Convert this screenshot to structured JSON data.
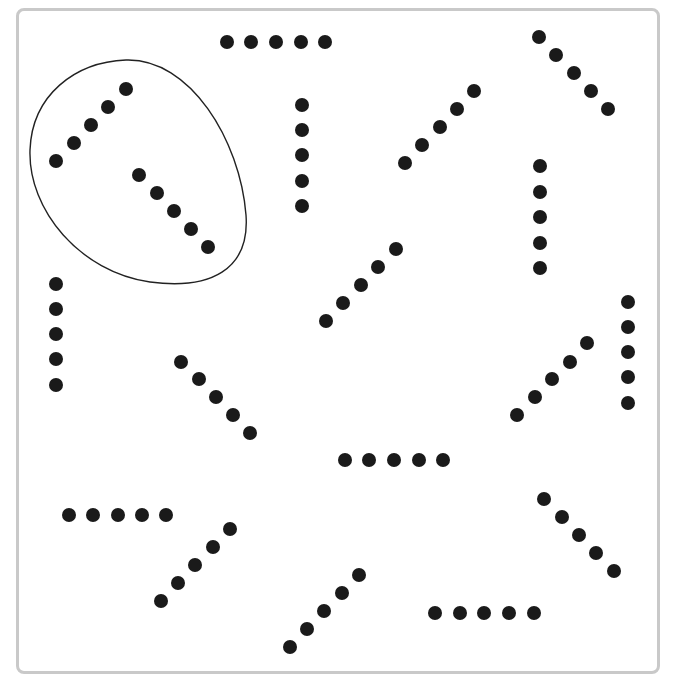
{
  "figure": {
    "frame_color": "#c9c9c9",
    "dot_color": "#1a1a1a",
    "dot_radius": 7,
    "loop": {
      "description": "hand-drawn egg-shaped loop enclosing two groups",
      "path": "M 126 60 C 190 58, 240 140, 246 215 C 250 270, 210 290, 150 282 C 80 272, 28 210, 30 150 C 32 95, 75 62, 126 60 Z"
    },
    "groups": [
      {
        "id": "g1",
        "orientation": "diagonal-up",
        "encircled": true,
        "dots": [
          [
            56,
            161
          ],
          [
            74,
            143
          ],
          [
            91,
            125
          ],
          [
            108,
            107
          ],
          [
            126,
            89
          ]
        ]
      },
      {
        "id": "g2",
        "orientation": "diagonal-down",
        "encircled": true,
        "dots": [
          [
            139,
            175
          ],
          [
            157,
            193
          ],
          [
            174,
            211
          ],
          [
            191,
            229
          ],
          [
            208,
            247
          ]
        ]
      },
      {
        "id": "g3",
        "orientation": "horizontal",
        "encircled": false,
        "dots": [
          [
            227,
            42
          ],
          [
            251,
            42
          ],
          [
            276,
            42
          ],
          [
            301,
            42
          ],
          [
            325,
            42
          ]
        ]
      },
      {
        "id": "g4",
        "orientation": "vertical",
        "encircled": false,
        "dots": [
          [
            302,
            105
          ],
          [
            302,
            130
          ],
          [
            302,
            155
          ],
          [
            302,
            181
          ],
          [
            302,
            206
          ]
        ]
      },
      {
        "id": "g5",
        "orientation": "diagonal-up",
        "encircled": false,
        "dots": [
          [
            405,
            163
          ],
          [
            422,
            145
          ],
          [
            440,
            127
          ],
          [
            457,
            109
          ],
          [
            474,
            91
          ]
        ]
      },
      {
        "id": "g6",
        "orientation": "diagonal-down",
        "encircled": false,
        "dots": [
          [
            539,
            37
          ],
          [
            556,
            55
          ],
          [
            574,
            73
          ],
          [
            591,
            91
          ],
          [
            608,
            109
          ]
        ]
      },
      {
        "id": "g7",
        "orientation": "vertical",
        "encircled": false,
        "dots": [
          [
            540,
            166
          ],
          [
            540,
            192
          ],
          [
            540,
            217
          ],
          [
            540,
            243
          ],
          [
            540,
            268
          ]
        ]
      },
      {
        "id": "g8",
        "orientation": "diagonal-up",
        "encircled": false,
        "dots": [
          [
            326,
            321
          ],
          [
            343,
            303
          ],
          [
            361,
            285
          ],
          [
            378,
            267
          ],
          [
            396,
            249
          ]
        ]
      },
      {
        "id": "g9",
        "orientation": "vertical",
        "encircled": false,
        "dots": [
          [
            56,
            284
          ],
          [
            56,
            309
          ],
          [
            56,
            334
          ],
          [
            56,
            359
          ],
          [
            56,
            385
          ]
        ]
      },
      {
        "id": "g10",
        "orientation": "diagonal-down",
        "encircled": false,
        "dots": [
          [
            181,
            362
          ],
          [
            199,
            379
          ],
          [
            216,
            397
          ],
          [
            233,
            415
          ],
          [
            250,
            433
          ]
        ]
      },
      {
        "id": "g11",
        "orientation": "vertical",
        "encircled": false,
        "dots": [
          [
            628,
            302
          ],
          [
            628,
            327
          ],
          [
            628,
            352
          ],
          [
            628,
            377
          ],
          [
            628,
            403
          ]
        ]
      },
      {
        "id": "g12",
        "orientation": "diagonal-up",
        "encircled": false,
        "dots": [
          [
            517,
            415
          ],
          [
            535,
            397
          ],
          [
            552,
            379
          ],
          [
            570,
            362
          ],
          [
            587,
            343
          ]
        ]
      },
      {
        "id": "g13",
        "orientation": "horizontal",
        "encircled": false,
        "dots": [
          [
            345,
            460
          ],
          [
            369,
            460
          ],
          [
            394,
            460
          ],
          [
            419,
            460
          ],
          [
            443,
            460
          ]
        ]
      },
      {
        "id": "g14",
        "orientation": "horizontal",
        "encircled": false,
        "dots": [
          [
            69,
            515
          ],
          [
            93,
            515
          ],
          [
            118,
            515
          ],
          [
            142,
            515
          ],
          [
            166,
            515
          ]
        ]
      },
      {
        "id": "g15",
        "orientation": "diagonal-up",
        "encircled": false,
        "dots": [
          [
            161,
            601
          ],
          [
            178,
            583
          ],
          [
            195,
            565
          ],
          [
            213,
            547
          ],
          [
            230,
            529
          ]
        ]
      },
      {
        "id": "g16",
        "orientation": "diagonal-down",
        "encircled": false,
        "dots": [
          [
            544,
            499
          ],
          [
            562,
            517
          ],
          [
            579,
            535
          ],
          [
            596,
            553
          ],
          [
            614,
            571
          ]
        ]
      },
      {
        "id": "g17",
        "orientation": "diagonal-up",
        "encircled": false,
        "dots": [
          [
            290,
            647
          ],
          [
            307,
            629
          ],
          [
            324,
            611
          ],
          [
            342,
            593
          ],
          [
            359,
            575
          ]
        ]
      },
      {
        "id": "g18",
        "orientation": "horizontal",
        "encircled": false,
        "dots": [
          [
            435,
            613
          ],
          [
            460,
            613
          ],
          [
            484,
            613
          ],
          [
            509,
            613
          ],
          [
            534,
            613
          ]
        ]
      }
    ]
  }
}
